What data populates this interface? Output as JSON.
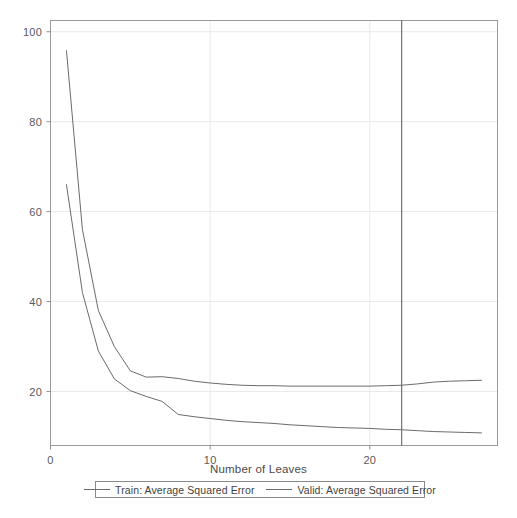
{
  "chart_data": {
    "type": "line",
    "title": "",
    "xlabel": "Number of Leaves",
    "ylabel": "",
    "xlim": [
      0,
      28
    ],
    "ylim": [
      8,
      102.5
    ],
    "xticks": [
      0,
      10,
      20
    ],
    "yticks": [
      20,
      40,
      60,
      80,
      100
    ],
    "xtick_labels": [
      "0",
      "10",
      "20"
    ],
    "ytick_labels": [
      "20",
      "40",
      "60",
      "80",
      "100"
    ],
    "grid": true,
    "legend_position": "below-axes",
    "annotations": [
      {
        "name": "selected-model-line",
        "type": "vline",
        "x": 22,
        "label": ""
      }
    ],
    "x": [
      1,
      2,
      3,
      4,
      5,
      6,
      7,
      8,
      9,
      10,
      11,
      12,
      13,
      14,
      15,
      16,
      17,
      18,
      19,
      20,
      21,
      22,
      23,
      24,
      25,
      26,
      27
    ],
    "series": [
      {
        "name": "Valid: Average Squared Error",
        "color": "#6b6b6b",
        "values": [
          95.8,
          56.0,
          38.0,
          30.0,
          24.6,
          23.2,
          23.3,
          22.9,
          22.3,
          21.9,
          21.6,
          21.4,
          21.3,
          21.3,
          21.2,
          21.2,
          21.2,
          21.2,
          21.2,
          21.2,
          21.3,
          21.4,
          21.7,
          22.1,
          22.3,
          22.4,
          22.5
        ]
      },
      {
        "name": "Train: Average Squared Error",
        "color": "#6b6b6b",
        "values": [
          66.0,
          42.0,
          29.0,
          22.8,
          20.2,
          18.9,
          17.8,
          14.9,
          14.4,
          14.0,
          13.6,
          13.3,
          13.1,
          12.9,
          12.6,
          12.4,
          12.2,
          12.0,
          11.9,
          11.8,
          11.6,
          11.5,
          11.3,
          11.1,
          11.0,
          10.9,
          10.8
        ]
      }
    ]
  },
  "axes": {
    "x_title": "Number of Leaves"
  },
  "legend": {
    "entries": [
      {
        "label": "Train: Average Squared Error",
        "swatch": "line-swatch"
      },
      {
        "label": "Valid: Average Squared Error",
        "swatch": "line-swatch"
      }
    ]
  }
}
